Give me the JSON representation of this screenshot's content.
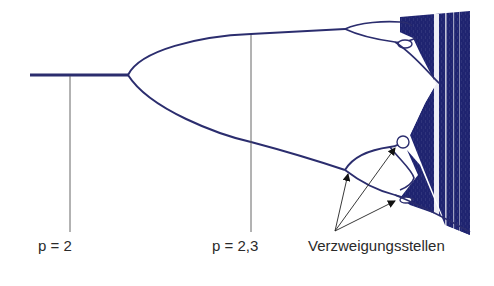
{
  "figure": {
    "type": "bifurcation-diagram",
    "colors": {
      "curve": "#2b2d6e",
      "chaos": "#1f2470",
      "guide": "#555555",
      "text": "#2a2a2a",
      "background": "#ffffff"
    }
  },
  "labels": {
    "p2": "p = 2",
    "p23": "p = 2,3",
    "branching_points": "Verzweigungsstellen"
  },
  "annotations": [
    {
      "text": "p = 2",
      "marker_x": 70,
      "attached_to": "single fixed point (period 1)"
    },
    {
      "text": "p = 2,3",
      "marker_x": 251,
      "attached_to": "period-2 branches"
    },
    {
      "text": "Verzweigungsstellen",
      "arrows": 3,
      "attached_to": "period-doubling bifurcation points"
    }
  ]
}
